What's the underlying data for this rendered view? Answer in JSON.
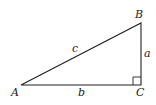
{
  "diagram": {
    "type": "right-triangle",
    "vertices": [
      {
        "id": "A",
        "label": "A",
        "x": 21,
        "y": 85
      },
      {
        "id": "B",
        "label": "B",
        "x": 141,
        "y": 23
      },
      {
        "id": "C",
        "label": "C",
        "x": 141,
        "y": 85
      }
    ],
    "sides": [
      {
        "id": "a",
        "label": "a",
        "from": "B",
        "to": "C"
      },
      {
        "id": "b",
        "label": "b",
        "from": "A",
        "to": "C"
      },
      {
        "id": "c",
        "label": "c",
        "from": "A",
        "to": "B"
      }
    ],
    "right_angle_at": "C",
    "stroke_color": "#222222"
  }
}
